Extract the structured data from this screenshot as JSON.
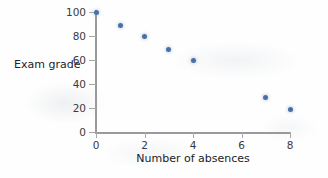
{
  "chart_data": {
    "type": "scatter",
    "title": "",
    "xlabel": "Number of absences",
    "ylabel": "Exam grade",
    "xlim": [
      0,
      8
    ],
    "ylim": [
      0,
      100
    ],
    "xticks": [
      0,
      2,
      4,
      6,
      8
    ],
    "yticks": [
      0,
      20,
      40,
      60,
      80,
      100
    ],
    "xtick_labels": [
      "0",
      "2",
      "4",
      "6",
      "8"
    ],
    "ytick_labels": [
      "0",
      "20",
      "40",
      "60",
      "80",
      "100"
    ],
    "grid": false,
    "legend": false,
    "marker_color": "#4a6fa5",
    "axis_color": "#9a9a9c",
    "background_color": "#fefefe",
    "points": [
      {
        "x": 0,
        "y": 100
      },
      {
        "x": 1,
        "y": 89
      },
      {
        "x": 2,
        "y": 80
      },
      {
        "x": 3,
        "y": 69
      },
      {
        "x": 4,
        "y": 60
      },
      {
        "x": 7,
        "y": 29
      },
      {
        "x": 8,
        "y": 19
      }
    ],
    "x": [
      0,
      1,
      2,
      3,
      4,
      7,
      8
    ],
    "values": [
      100,
      89,
      80,
      69,
      60,
      29,
      19
    ]
  }
}
